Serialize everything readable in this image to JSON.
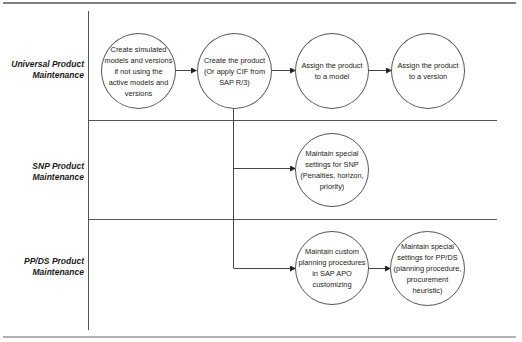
{
  "lanes": [
    {
      "id": "universal",
      "label_line1": "Universal Product",
      "label_line2": "Maintenance"
    },
    {
      "id": "snp",
      "label_line1": "SNP Product",
      "label_line2": "Maintenance"
    },
    {
      "id": "ppds",
      "label_line1": "PP/DS Product",
      "label_line2": "Maintenance"
    }
  ],
  "nodes": {
    "create_simulated": "Create simulated models and versions if not using the active models and versions",
    "create_product": "Create the product (Or apply CIF from SAP R/3)",
    "assign_model": "Assign the product to a model",
    "assign_version": "Assign the product to a version",
    "snp_settings": "Maintain special settings for SNP (Penalties, horizon, priority)",
    "custom_planning": "Maintain custom planning procedures in SAP APO customizing",
    "ppds_settings": "Maintain special settings for PP/DS (planning procedure, procurement heuristic)"
  },
  "colors": {
    "line": "#444444",
    "rule": "#555555",
    "node_border": "#555555"
  }
}
